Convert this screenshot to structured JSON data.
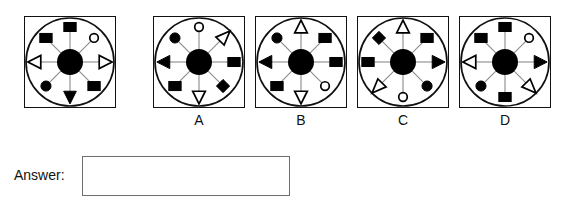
{
  "page": {
    "type": "visual-analogy-multiple-choice",
    "background": "#ffffff",
    "ink": "#111111",
    "spoke_color": "#8a8a8a",
    "box_border": "#6e6e6e"
  },
  "answer": {
    "label": "Answer:",
    "value": "",
    "placeholder": ""
  },
  "geometry": {
    "panel_size": 92,
    "hub_radius": 13,
    "inner_ring_radius": 44,
    "spoke_length": 30,
    "shape_size": 11,
    "directions": [
      "NW",
      "N",
      "NE",
      "W",
      "E",
      "SW",
      "S",
      "SE"
    ]
  },
  "panels": [
    {
      "id": "question",
      "label": "",
      "x": 24,
      "shapes": [
        {
          "dir": "NW",
          "shape": "square",
          "fill": "filled"
        },
        {
          "dir": "N",
          "shape": "square",
          "fill": "filled"
        },
        {
          "dir": "NE",
          "shape": "circle",
          "fill": "open"
        },
        {
          "dir": "W",
          "shape": "triangle-left",
          "fill": "open"
        },
        {
          "dir": "E",
          "shape": "triangle-right",
          "fill": "open"
        },
        {
          "dir": "SW",
          "shape": "circle",
          "fill": "filled"
        },
        {
          "dir": "S",
          "shape": "triangle-down",
          "fill": "filled"
        },
        {
          "dir": "SE",
          "shape": "square",
          "fill": "filled"
        }
      ]
    },
    {
      "id": "option-a",
      "label": "A",
      "x": 153,
      "shapes": [
        {
          "dir": "NW",
          "shape": "circle",
          "fill": "filled"
        },
        {
          "dir": "N",
          "shape": "circle",
          "fill": "open"
        },
        {
          "dir": "NE",
          "shape": "triangle-ne",
          "fill": "open"
        },
        {
          "dir": "W",
          "shape": "triangle-left",
          "fill": "filled"
        },
        {
          "dir": "E",
          "shape": "square",
          "fill": "filled"
        },
        {
          "dir": "SW",
          "shape": "square",
          "fill": "filled"
        },
        {
          "dir": "S",
          "shape": "triangle-down",
          "fill": "open"
        },
        {
          "dir": "SE",
          "shape": "diamond",
          "fill": "filled"
        }
      ]
    },
    {
      "id": "option-b",
      "label": "B",
      "x": 255,
      "shapes": [
        {
          "dir": "NW",
          "shape": "circle",
          "fill": "filled"
        },
        {
          "dir": "N",
          "shape": "triangle-up",
          "fill": "open"
        },
        {
          "dir": "NE",
          "shape": "square",
          "fill": "filled"
        },
        {
          "dir": "W",
          "shape": "triangle-left",
          "fill": "filled"
        },
        {
          "dir": "E",
          "shape": "square",
          "fill": "filled"
        },
        {
          "dir": "SW",
          "shape": "square",
          "fill": "filled"
        },
        {
          "dir": "S",
          "shape": "triangle-down",
          "fill": "open"
        },
        {
          "dir": "SE",
          "shape": "circle",
          "fill": "open"
        }
      ]
    },
    {
      "id": "option-c",
      "label": "C",
      "x": 357,
      "shapes": [
        {
          "dir": "NW",
          "shape": "diamond",
          "fill": "filled"
        },
        {
          "dir": "N",
          "shape": "triangle-up",
          "fill": "open"
        },
        {
          "dir": "NE",
          "shape": "square",
          "fill": "filled"
        },
        {
          "dir": "W",
          "shape": "square",
          "fill": "filled"
        },
        {
          "dir": "E",
          "shape": "triangle-right",
          "fill": "filled"
        },
        {
          "dir": "SW",
          "shape": "triangle-sw",
          "fill": "open"
        },
        {
          "dir": "S",
          "shape": "circle",
          "fill": "open"
        },
        {
          "dir": "SE",
          "shape": "circle",
          "fill": "filled"
        }
      ]
    },
    {
      "id": "option-d",
      "label": "D",
      "x": 459,
      "shapes": [
        {
          "dir": "NW",
          "shape": "square",
          "fill": "filled"
        },
        {
          "dir": "N",
          "shape": "square",
          "fill": "filled"
        },
        {
          "dir": "NE",
          "shape": "circle",
          "fill": "open"
        },
        {
          "dir": "W",
          "shape": "triangle-left",
          "fill": "open"
        },
        {
          "dir": "E",
          "shape": "triangle-right",
          "fill": "filled"
        },
        {
          "dir": "SW",
          "shape": "circle",
          "fill": "filled"
        },
        {
          "dir": "S",
          "shape": "square",
          "fill": "filled"
        },
        {
          "dir": "SE",
          "shape": "triangle-se",
          "fill": "open"
        }
      ]
    }
  ]
}
